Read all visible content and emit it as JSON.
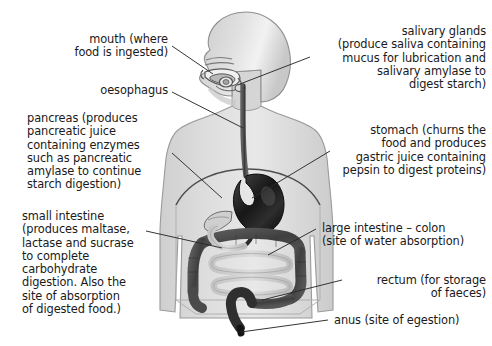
{
  "diagram": {
    "background_color": "#ffffff",
    "text_color": "#1a1a1a",
    "body_fill": "#d9d9d9",
    "body_outline": "#8a8a8a",
    "organ_dark": "#4a4a4a",
    "organ_darkest": "#1f1f1f",
    "organ_light": "#c9c9c9",
    "leader_line_color": "#2a2a2a"
  },
  "labels": {
    "mouth": "mouth (where\nfood is ingested)",
    "oesophagus": "oesophagus",
    "pancreas": "pancreas (produces\npancreatic juice\ncontaining enzymes\nsuch as pancreatic\namylase to continue\nstarch digestion)",
    "small_intestine": "small intestine\n(produces maltase,\nlactase and sucrase\nto complete\ncarbohydrate\ndigestion. Also the\nsite of absorption\nof digested food.)",
    "salivary_glands": "salivary glands\n(produce saliva containing\nmucus for lubrication and\nsalivary amylase to\ndigest starch)",
    "stomach": "stomach (churns the\nfood and produces\ngastric juice containing\npepsin to digest proteins)",
    "large_intestine": "large intestine – colon\n(site of water absorption)",
    "rectum": "rectum (for storage\nof faeces)",
    "anus": "anus (site of egestion)"
  },
  "organs": [
    {
      "name": "mouth",
      "label_key": "mouth"
    },
    {
      "name": "oesophagus",
      "label_key": "oesophagus"
    },
    {
      "name": "pancreas",
      "label_key": "pancreas"
    },
    {
      "name": "small-intestine",
      "label_key": "small_intestine"
    },
    {
      "name": "salivary-glands",
      "label_key": "salivary_glands"
    },
    {
      "name": "stomach",
      "label_key": "stomach"
    },
    {
      "name": "large-intestine-colon",
      "label_key": "large_intestine"
    },
    {
      "name": "rectum",
      "label_key": "rectum"
    },
    {
      "name": "anus",
      "label_key": "anus"
    }
  ]
}
